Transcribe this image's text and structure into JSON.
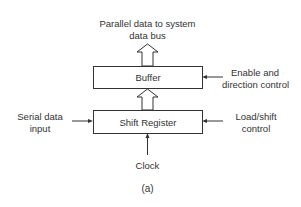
{
  "diagram": {
    "title_top": {
      "line1": "Parallel data to system",
      "line2": "data bus"
    },
    "blocks": {
      "buffer": {
        "label": "Buffer"
      },
      "shift_register": {
        "label": "Shift Register"
      }
    },
    "inputs": {
      "serial": {
        "line1": "Serial data",
        "line2": "input"
      },
      "enable": {
        "line1": "Enable and",
        "line2": "direction control"
      },
      "load": {
        "line1": "Load/shift",
        "line2": "control"
      },
      "clock": {
        "label": "Clock"
      }
    },
    "caption": "(a)",
    "colors": {
      "stroke": "#333333",
      "background": "#ffffff"
    }
  }
}
